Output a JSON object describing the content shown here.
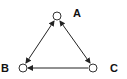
{
  "diagram": {
    "type": "directed-graph",
    "nodes": [
      {
        "id": "A",
        "label": "A",
        "x": 57,
        "y": 16,
        "label_x": 73,
        "label_y": 17
      },
      {
        "id": "B",
        "label": "B",
        "x": 23,
        "y": 68,
        "label_x": 1,
        "label_y": 72
      },
      {
        "id": "C",
        "label": "C",
        "x": 93,
        "y": 68,
        "label_x": 110,
        "label_y": 72
      }
    ],
    "edges": [
      {
        "from": "A",
        "to": "B",
        "direction": "both"
      },
      {
        "from": "A",
        "to": "C",
        "direction": "both"
      },
      {
        "from": "C",
        "to": "B",
        "direction": "forward"
      }
    ],
    "colors": {
      "line": "#222222",
      "node_stroke": "#333333",
      "background": "#ffffff"
    }
  }
}
